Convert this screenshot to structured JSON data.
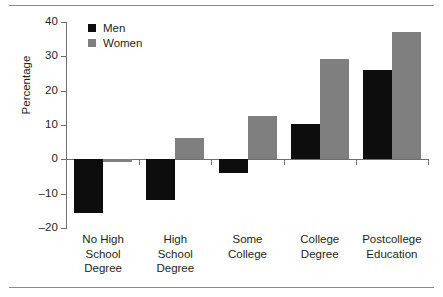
{
  "chart_data": {
    "type": "bar",
    "title": "",
    "subtitle": "",
    "xlabel": "",
    "ylabel": "Percentage",
    "ylim": [
      -20,
      40
    ],
    "yticks": [
      40,
      30,
      20,
      10,
      0,
      -10,
      -20
    ],
    "ytick_labels": [
      "40",
      "30",
      "20",
      "10",
      "0",
      "–10",
      "–20"
    ],
    "grid": false,
    "legend_position": "top-left",
    "categories": [
      "No High School Degree",
      "High School Degree",
      "Some College",
      "College Degree",
      "Postcollege Education"
    ],
    "category_lines": [
      [
        "No High",
        "School",
        "Degree"
      ],
      [
        "High",
        "School",
        "Degree"
      ],
      [
        "Some",
        "College"
      ],
      [
        "College",
        "Degree"
      ],
      [
        "Postcollege",
        "Education"
      ]
    ],
    "series": [
      {
        "name": "Men",
        "color": "#0d0d0d",
        "values": [
          -15.7,
          -11.8,
          -4.1,
          10.2,
          26.0
        ]
      },
      {
        "name": "Women",
        "color": "#7f7f7f",
        "values": [
          -0.8,
          6.2,
          12.5,
          29.1,
          37.0
        ]
      }
    ]
  },
  "legend": {
    "items": [
      {
        "label": "Men",
        "color": "#0d0d0d"
      },
      {
        "label": "Women",
        "color": "#7f7f7f"
      }
    ]
  },
  "axes": {
    "y_axis_title": "Percentage"
  },
  "colors": {
    "men": "#0d0d0d",
    "women": "#7f7f7f",
    "axis": "#6f6f6f",
    "rule": "#8a8a8a",
    "text": "#231f20",
    "background": "#ffffff"
  }
}
